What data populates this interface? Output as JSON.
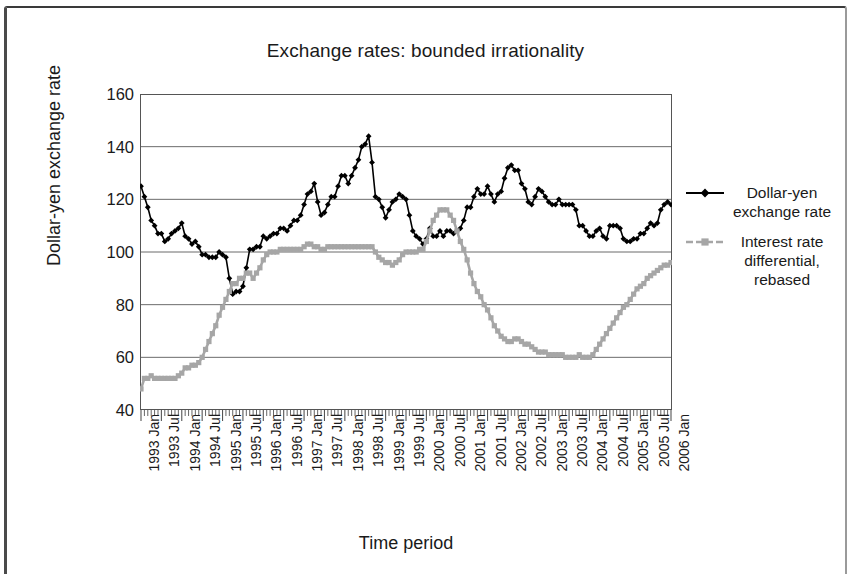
{
  "figure": {
    "title": "Exchange rates: bounded irrationality",
    "xlabel": "Time period",
    "ylabel": "Dollar-yen exchange rate"
  },
  "legend": {
    "position": "right",
    "items": [
      {
        "label": "Dollar-yen exchange rate",
        "color": "#000000",
        "marker": "diamond"
      },
      {
        "label": "Interest rate differential, rebased",
        "color": "#a6a6a6",
        "marker": "square"
      }
    ]
  },
  "axes": {
    "y_ticks": [
      160,
      140,
      120,
      100,
      80,
      60,
      40
    ],
    "ylim": [
      40,
      160
    ],
    "grid": "horizontal",
    "x_tick_labels": [
      "1993 Jan",
      "1993 Jul",
      "1994 Jan",
      "1994 Jul",
      "1995 Jan",
      "1995 Jul",
      "1996 Jan",
      "1996 Jul",
      "1997 Jan",
      "1997 Jul",
      "1998 Jan",
      "1998 Jul",
      "1999 Jan",
      "1999 Jul",
      "2000 Jan",
      "2000 Jul",
      "2001 Jan",
      "2001 Jul",
      "2002 Jan",
      "2002 Jul",
      "2003 Jan",
      "2003 Jul",
      "2004 Jan",
      "2004 Jul",
      "2005 Jan",
      "2005 Jul",
      "2006 Jan"
    ]
  },
  "chart_data": {
    "type": "line",
    "title": "Exchange rates: bounded irrationality",
    "xlabel": "Time period",
    "ylabel": "Dollar-yen exchange rate",
    "ylim": [
      40,
      160
    ],
    "yticks": [
      40,
      60,
      80,
      100,
      120,
      140,
      160
    ],
    "grid": "horizontal gridlines only",
    "legend_position": "right",
    "x_start": "1993-01",
    "x_end": "2006-01",
    "x_interval": "monthly (labels every 6 months)",
    "x": [
      "1993 Jan",
      "1993 Feb",
      "1993 Mar",
      "1993 Apr",
      "1993 May",
      "1993 Jun",
      "1993 Jul",
      "1993 Aug",
      "1993 Sep",
      "1993 Oct",
      "1993 Nov",
      "1993 Dec",
      "1994 Jan",
      "1994 Feb",
      "1994 Mar",
      "1994 Apr",
      "1994 May",
      "1994 Jun",
      "1994 Jul",
      "1994 Aug",
      "1994 Sep",
      "1994 Oct",
      "1994 Nov",
      "1994 Dec",
      "1995 Jan",
      "1995 Feb",
      "1995 Mar",
      "1995 Apr",
      "1995 May",
      "1995 Jun",
      "1995 Jul",
      "1995 Aug",
      "1995 Sep",
      "1995 Oct",
      "1995 Nov",
      "1995 Dec",
      "1996 Jan",
      "1996 Feb",
      "1996 Mar",
      "1996 Apr",
      "1996 May",
      "1996 Jun",
      "1996 Jul",
      "1996 Aug",
      "1996 Sep",
      "1996 Oct",
      "1996 Nov",
      "1996 Dec",
      "1997 Jan",
      "1997 Feb",
      "1997 Mar",
      "1997 Apr",
      "1997 May",
      "1997 Jun",
      "1997 Jul",
      "1997 Aug",
      "1997 Sep",
      "1997 Oct",
      "1997 Nov",
      "1997 Dec",
      "1998 Jan",
      "1998 Feb",
      "1998 Mar",
      "1998 Apr",
      "1998 May",
      "1998 Jun",
      "1998 Jul",
      "1998 Aug",
      "1998 Sep",
      "1998 Oct",
      "1998 Nov",
      "1998 Dec",
      "1999 Jan",
      "1999 Feb",
      "1999 Mar",
      "1999 Apr",
      "1999 May",
      "1999 Jun",
      "1999 Jul",
      "1999 Aug",
      "1999 Sep",
      "1999 Oct",
      "1999 Nov",
      "1999 Dec",
      "2000 Jan",
      "2000 Feb",
      "2000 Mar",
      "2000 Apr",
      "2000 May",
      "2000 Jun",
      "2000 Jul",
      "2000 Aug",
      "2000 Sep",
      "2000 Oct",
      "2000 Nov",
      "2000 Dec",
      "2001 Jan",
      "2001 Feb",
      "2001 Mar",
      "2001 Apr",
      "2001 May",
      "2001 Jun",
      "2001 Jul",
      "2001 Aug",
      "2001 Sep",
      "2001 Oct",
      "2001 Nov",
      "2001 Dec",
      "2002 Jan",
      "2002 Feb",
      "2002 Mar",
      "2002 Apr",
      "2002 May",
      "2002 Jun",
      "2002 Jul",
      "2002 Aug",
      "2002 Sep",
      "2002 Oct",
      "2002 Nov",
      "2002 Dec",
      "2003 Jan",
      "2003 Feb",
      "2003 Mar",
      "2003 Apr",
      "2003 May",
      "2003 Jun",
      "2003 Jul",
      "2003 Aug",
      "2003 Sep",
      "2003 Oct",
      "2003 Nov",
      "2003 Dec",
      "2004 Jan",
      "2004 Feb",
      "2004 Mar",
      "2004 Apr",
      "2004 May",
      "2004 Jun",
      "2004 Jul",
      "2004 Aug",
      "2004 Sep",
      "2004 Oct",
      "2004 Nov",
      "2004 Dec",
      "2005 Jan",
      "2005 Feb",
      "2005 Mar",
      "2005 Apr",
      "2005 May",
      "2005 Jun",
      "2005 Jul",
      "2005 Aug",
      "2005 Sep",
      "2005 Oct",
      "2005 Nov",
      "2005 Dec",
      "2006 Jan"
    ],
    "series": [
      {
        "name": "Dollar-yen exchange rate",
        "color": "#000000",
        "marker": "diamond",
        "values": [
          125,
          121,
          117,
          112,
          110,
          107,
          107,
          104,
          105,
          107,
          108,
          109,
          111,
          106,
          105,
          103,
          104,
          102,
          99,
          99,
          98,
          98,
          98,
          100,
          99,
          98,
          90,
          84,
          85,
          85,
          87,
          94,
          101,
          101,
          102,
          102,
          106,
          105,
          106,
          107,
          107,
          109,
          109,
          108,
          110,
          112,
          112,
          114,
          118,
          122,
          123,
          126,
          119,
          114,
          115,
          118,
          121,
          121,
          125,
          129,
          129,
          126,
          129,
          132,
          135,
          140,
          141,
          144,
          134,
          121,
          120,
          117,
          113,
          116,
          119,
          120,
          122,
          121,
          120,
          114,
          108,
          106,
          105,
          103,
          105,
          109,
          106,
          106,
          108,
          106,
          108,
          108,
          107,
          108,
          109,
          112,
          117,
          117,
          121,
          124,
          122,
          122,
          125,
          122,
          119,
          122,
          123,
          128,
          132,
          133,
          131,
          131,
          126,
          124,
          119,
          118,
          121,
          124,
          123,
          121,
          119,
          118,
          118,
          120,
          118,
          118,
          118,
          118,
          116,
          110,
          110,
          108,
          106,
          106,
          108,
          109,
          106,
          105,
          110,
          110,
          110,
          109,
          105,
          104,
          104,
          105,
          105,
          107,
          107,
          109,
          111,
          110,
          111,
          116,
          118,
          119,
          118
        ]
      },
      {
        "name": "Interest rate differential, rebased",
        "color": "#a6a6a6",
        "marker": "square",
        "values": [
          48,
          52,
          52,
          53,
          52,
          52,
          52,
          52,
          52,
          52,
          52,
          53,
          54,
          56,
          56,
          57,
          57,
          58,
          60,
          63,
          66,
          69,
          72,
          76,
          79,
          82,
          85,
          88,
          88,
          90,
          90,
          92,
          92,
          90,
          92,
          94,
          97,
          99,
          100,
          100,
          100,
          101,
          101,
          101,
          101,
          101,
          101,
          101,
          102,
          103,
          103,
          102,
          102,
          101,
          101,
          102,
          102,
          102,
          102,
          102,
          102,
          102,
          102,
          102,
          102,
          102,
          102,
          102,
          102,
          100,
          98,
          97,
          96,
          96,
          95,
          96,
          97,
          99,
          100,
          100,
          100,
          100,
          101,
          101,
          104,
          108,
          112,
          114,
          116,
          116,
          116,
          114,
          112,
          108,
          104,
          101,
          97,
          92,
          88,
          85,
          83,
          80,
          78,
          75,
          72,
          70,
          68,
          67,
          66,
          66,
          67,
          67,
          66,
          65,
          65,
          64,
          63,
          62,
          62,
          62,
          61,
          61,
          61,
          61,
          61,
          60,
          60,
          60,
          60,
          61,
          60,
          60,
          60,
          61,
          63,
          65,
          67,
          69,
          71,
          73,
          75,
          77,
          79,
          80,
          82,
          84,
          86,
          87,
          88,
          90,
          91,
          92,
          93,
          94,
          95,
          95,
          96
        ]
      }
    ],
    "annotations": [
      "Dollar-yen starts near 125 in 1993 Jan, troughs near 84 in 1995 Apr, peaks near 144 in 1998 Aug, ends near 118 in 2006 Jan.",
      "Interest rate differential starts near 48, rises to about 102 by 1997, peaks near 116 in 2000 May-Jul, falls to about 60 through 2003-2004, then climbs to about 96 by 2006 Jan."
    ]
  }
}
